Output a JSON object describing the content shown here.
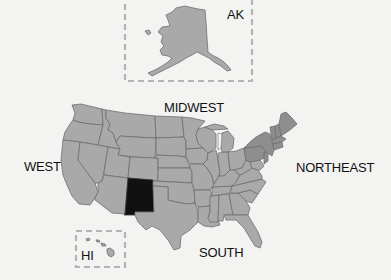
{
  "map": {
    "title": "United States Census Regions",
    "regions": [
      {
        "id": "west",
        "label": "WEST"
      },
      {
        "id": "midwest",
        "label": "MIDWEST"
      },
      {
        "id": "northeast",
        "label": "NORTHEAST"
      },
      {
        "id": "south",
        "label": "SOUTH"
      }
    ],
    "insets": [
      {
        "id": "alaska",
        "label": "AK"
      },
      {
        "id": "hawaii",
        "label": "HI"
      }
    ],
    "highlighted_state": "New Mexico",
    "colors": {
      "background": "#f3f3f2",
      "state_fill": "#a9a9a9",
      "northeast_fill": "#8e8e8e",
      "highlight_fill": "#111111",
      "border": "#6e6e6e",
      "inset_border": "#b4b4b4"
    }
  }
}
